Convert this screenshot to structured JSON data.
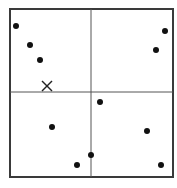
{
  "diagram": {
    "type": "quadrant-scatter",
    "colors": {
      "background": "#ffffff",
      "frame": "#3a3a3a",
      "dividers": "#555555",
      "points": "#111111",
      "marker": "#222222"
    },
    "frame": {
      "x1": 10,
      "y1": 9,
      "x2": 173,
      "y2": 177
    },
    "dividers": {
      "vertical_x": 91,
      "horizontal_y": 92
    },
    "points": [
      {
        "x": 16,
        "y": 26
      },
      {
        "x": 30,
        "y": 45
      },
      {
        "x": 40,
        "y": 60
      },
      {
        "x": 165,
        "y": 31
      },
      {
        "x": 156,
        "y": 50
      },
      {
        "x": 100,
        "y": 102
      },
      {
        "x": 52,
        "y": 127
      },
      {
        "x": 147,
        "y": 131
      },
      {
        "x": 91,
        "y": 155
      },
      {
        "x": 77,
        "y": 165
      },
      {
        "x": 161,
        "y": 165
      }
    ],
    "marker": {
      "symbol": "x",
      "x": 47,
      "y": 86,
      "size": 5
    }
  }
}
